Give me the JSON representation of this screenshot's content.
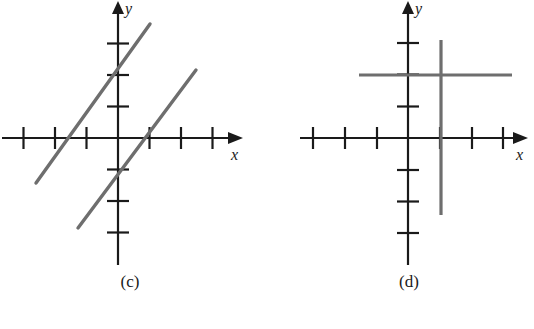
{
  "figure": {
    "kind": "math-graph-figure",
    "background_color": "#ffffff",
    "axis_color": "#1a1a1a",
    "line_color": "#6e6e6e",
    "panels": [
      {
        "id": "c",
        "caption": "(c)",
        "x_axis_label": "x",
        "y_axis_label": "y",
        "origin": {
          "x": 118,
          "y": 138
        },
        "tick_spacing": 31.5,
        "x_ticks": [
          -3,
          -2,
          -1,
          1,
          2,
          3
        ],
        "y_ticks": [
          -3,
          -2,
          -1,
          1,
          2,
          3
        ],
        "x_range": [
          -3.7,
          3.6
        ],
        "y_range": [
          -4.3,
          4.3
        ],
        "lines": [
          {
            "name": "line-steep-left",
            "from": {
              "x": -2.6,
              "y": -1.43
            },
            "to": {
              "x": 1.02,
              "y": 3.62
            },
            "slope": 1.4,
            "y_intercept": 2.05,
            "x_intercept": -1.47
          },
          {
            "name": "line-steep-right",
            "from": {
              "x": -1.27,
              "y": -2.86
            },
            "to": {
              "x": 2.48,
              "y": 2.16
            },
            "slope": 1.34,
            "y_intercept": -1.16,
            "x_intercept": 0.95
          }
        ]
      },
      {
        "id": "d",
        "caption": "(d)",
        "x_axis_label": "x",
        "y_axis_label": "y",
        "origin": {
          "x": 141,
          "y": 138
        },
        "tick_spacing": 31.7,
        "x_ticks": [
          -3,
          -2,
          -1,
          1,
          2,
          3
        ],
        "y_ticks": [
          -3,
          -2,
          -1,
          1,
          2,
          3
        ],
        "x_range": [
          -3.7,
          3.7
        ],
        "y_range": [
          -4.3,
          4.3
        ],
        "lines": [
          {
            "name": "line-vertical",
            "orientation": "vertical",
            "at": 1.0,
            "from": {
              "x": 1.0,
              "y": 3.09
            },
            "to": {
              "x": 1.0,
              "y": -2.43
            }
          },
          {
            "name": "line-horizontal",
            "orientation": "horizontal",
            "at": 2.0,
            "from": {
              "x": -1.55,
              "y": 2.0
            },
            "to": {
              "x": 3.25,
              "y": 2.0
            }
          }
        ]
      }
    ]
  }
}
